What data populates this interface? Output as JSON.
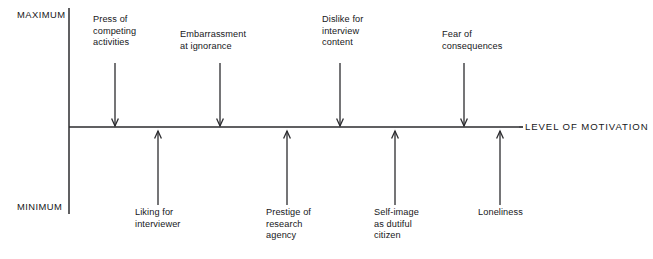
{
  "figure": {
    "type": "motivation-force-field-diagram",
    "axis_title": "LEVEL OF MOTIVATION",
    "scale_max_label": "MAXIMUM",
    "scale_min_label": "MINIMUM",
    "baseline_y": 127,
    "axis_start_x": 69,
    "axis_end_x": 519,
    "vertical_axis_top_y": 8,
    "vertical_axis_bottom_y": 214
  },
  "negative_forces": {
    "heading": "Forces above the line (arrows pointing down)",
    "items": [
      {
        "label": "Press of\ncompeting\nactivities",
        "arrow_x": 115,
        "arrow_top_y": 63,
        "arrow_tip_y": 126,
        "text_x": 93,
        "text_y": 14,
        "direction": "down"
      },
      {
        "label": "Embarrassment\nat ignorance",
        "arrow_x": 220,
        "arrow_top_y": 63,
        "arrow_tip_y": 126,
        "text_x": 180,
        "text_y": 29,
        "direction": "down"
      },
      {
        "label": "Dislike for\ninterview\ncontent",
        "arrow_x": 340,
        "arrow_top_y": 63,
        "arrow_tip_y": 126,
        "text_x": 322,
        "text_y": 14,
        "direction": "down"
      },
      {
        "label": "Fear of\nconsequences",
        "arrow_x": 464,
        "arrow_top_y": 63,
        "arrow_tip_y": 126,
        "text_x": 442,
        "text_y": 29,
        "direction": "down"
      }
    ]
  },
  "positive_forces": {
    "heading": "Forces below the line (arrows pointing up)",
    "items": [
      {
        "label": "Liking for\ninterviewer",
        "arrow_x": 158,
        "arrow_bottom_y": 205,
        "arrow_tip_y": 131,
        "text_x": 135,
        "text_y": 207,
        "direction": "up"
      },
      {
        "label": "Prestige of\nresearch\nagency",
        "arrow_x": 287,
        "arrow_bottom_y": 205,
        "arrow_tip_y": 131,
        "text_x": 266,
        "text_y": 207,
        "direction": "up"
      },
      {
        "label": "Self-image\nas dutiful\ncitizen",
        "arrow_x": 395,
        "arrow_bottom_y": 205,
        "arrow_tip_y": 131,
        "text_x": 374,
        "text_y": 207,
        "direction": "up"
      },
      {
        "label": "Loneliness",
        "arrow_x": 500,
        "arrow_bottom_y": 205,
        "arrow_tip_y": 131,
        "text_x": 478,
        "text_y": 207,
        "direction": "up"
      }
    ]
  },
  "colors": {
    "ink": "#17171a",
    "line": "#2b2b2e",
    "background": "#ffffff"
  }
}
